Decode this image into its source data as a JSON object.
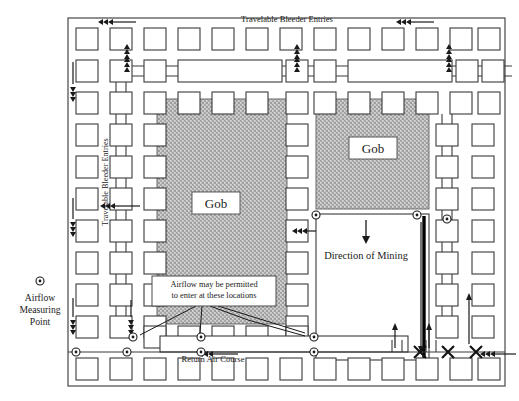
{
  "diagram": {
    "labels": {
      "top_entries": "Travelable Bleeder Entries",
      "left_entries": "Travelable Bleeder Entries",
      "bottom_course": "Return Air Course",
      "direction_of_mining": "Direction of Mining",
      "gob_left": "Gob",
      "gob_right": "Gob",
      "callout": "Airflow may be permitted to enter at these locations",
      "callout_line1": "Airflow may be permitted",
      "callout_line2": "to enter at these locations",
      "legend_line1": "Airflow",
      "legend_line2": "Measuring",
      "legend_line3": "Point"
    },
    "colors": {
      "ink": "#1a1a1a",
      "pillar_stroke": "#3a3a3a",
      "gob_fill": "#b9b9b9",
      "gob_stroke": "#555555",
      "face_line": "#000000",
      "background": "#ffffff",
      "border": "#444444"
    },
    "symbols": {
      "measuring_point": "circled-dot",
      "airflow_arrow": "triple-chevron",
      "overcast": "x-crossing",
      "stopping": "double-bar"
    },
    "geometry": {
      "border": {
        "x": 68,
        "y": 18,
        "w": 437,
        "h": 368
      },
      "gob_left": {
        "x": 157,
        "y": 99,
        "w": 130,
        "h": 225
      },
      "gob_right": {
        "x": 316,
        "y": 99,
        "w": 113,
        "h": 110
      },
      "panel_active": {
        "x": 316,
        "y": 214,
        "w": 113,
        "h": 146
      }
    }
  }
}
